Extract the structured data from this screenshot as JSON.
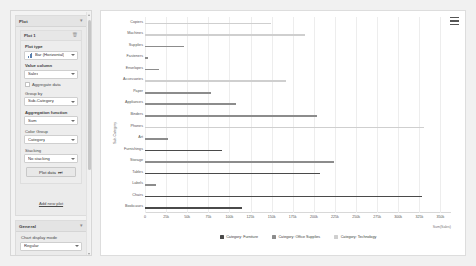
{
  "sidebar": {
    "plot_panel": {
      "title": "Plot",
      "collapse_icon": "chevron-icon",
      "plot_item": {
        "title": "Plot 1",
        "delete_icon": "trash-icon",
        "fields": {
          "plot_type_label": "Plot type",
          "plot_type_value": "Bar (Horizontal)",
          "value_column_label": "Value column",
          "value_column_value": "Sales",
          "aggregate_label": "Aggregate data",
          "group_by_label": "Group by",
          "group_by_value": "Sub-Category",
          "aggregation_function_label": "Aggregation function",
          "aggregation_function_value": "Sum",
          "color_group_label": "Color Group",
          "color_group_value": "Category",
          "stacking_label": "Stacking",
          "stacking_value": "No stacking"
        },
        "plot_data_button": "Plot data"
      },
      "add_new_plot": "Add new plot"
    },
    "general_panel": {
      "title": "General",
      "collapse_icon": "chevron-icon",
      "chart_display_mode_label": "Chart display mode",
      "chart_display_mode_value": "Regular"
    }
  },
  "chart_panel": {
    "menu_icon": "hamburger-menu-icon"
  },
  "chart_data": {
    "type": "bar",
    "orientation": "horizontal",
    "title": "",
    "xlabel": "Sum(Sales)",
    "ylabel": "Sub-Category",
    "xlim": [
      0,
      362500
    ],
    "xticks": [
      0,
      25000,
      50000,
      75000,
      100000,
      125000,
      150000,
      175000,
      200000,
      225000,
      250000,
      275000,
      300000,
      325000,
      350000
    ],
    "xtick_labels": [
      "0",
      "25k",
      "50k",
      "75k",
      "100k",
      "125k",
      "150k",
      "175k",
      "200k",
      "225k",
      "250k",
      "275k",
      "300k",
      "325k",
      "350k"
    ],
    "grid": true,
    "legend_position": "bottom",
    "categories": [
      "Copiers",
      "Machines",
      "Supplies",
      "Fasteners",
      "Envelopes",
      "Accessories",
      "Paper",
      "Appliances",
      "Binders",
      "Phones",
      "Art",
      "Furnishings",
      "Storage",
      "Tables",
      "Labels",
      "Chairs",
      "Bookcases"
    ],
    "values": [
      149528,
      189239,
      46674,
      3024,
      16476,
      167380,
      78479,
      107532,
      203413,
      330007,
      27119,
      91705,
      223844,
      206966,
      12486,
      328449,
      114880
    ],
    "color_groups": [
      "Technology",
      "Technology",
      "Office Supplies",
      "Office Supplies",
      "Office Supplies",
      "Technology",
      "Office Supplies",
      "Office Supplies",
      "Office Supplies",
      "Technology",
      "Office Supplies",
      "Furniture",
      "Office Supplies",
      "Furniture",
      "Office Supplies",
      "Furniture",
      "Furniture"
    ],
    "series": [
      {
        "name": "Category: Furniture",
        "color": "#4a4a4a",
        "swatch": "#4a4a4a"
      },
      {
        "name": "Category: Office Supplies",
        "color": "#8c8c8c",
        "swatch": "#8c8c8c"
      },
      {
        "name": "Category: Technology",
        "color": "#cfcfcf",
        "swatch": "#cfcfcf"
      }
    ],
    "legend": [
      "Category: Furniture",
      "Category: Office Supplies",
      "Category: Technology"
    ]
  }
}
